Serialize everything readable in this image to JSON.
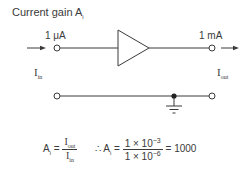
{
  "title": {
    "text": "Current gain A",
    "subscript": "i"
  },
  "circuit": {
    "input_current_label": "1 μA",
    "output_current_label": "1 mA",
    "input_name": {
      "base": "I",
      "sub": "in"
    },
    "output_name": {
      "base": "I",
      "sub": "out"
    },
    "amplifier_symbol": "triangle-amplifier",
    "ground_symbol": "ground"
  },
  "formula": {
    "lhs": {
      "base": "A",
      "sub": "i"
    },
    "equals": "=",
    "ratio": {
      "num": {
        "base": "I",
        "sub": "out"
      },
      "den": {
        "base": "I",
        "sub": "in"
      }
    },
    "therefore": "∴",
    "lhs2": {
      "base": "A",
      "sub": "i"
    },
    "equals2": "=",
    "value_fraction": {
      "num": {
        "mantissa": "1 × 10",
        "exp": "−3"
      },
      "den": {
        "mantissa": "1 × 10",
        "exp": "−6"
      }
    },
    "equals3": "=",
    "result": "1000"
  },
  "colors": {
    "ink": "#3a3a3a",
    "background": "#ffffff"
  }
}
